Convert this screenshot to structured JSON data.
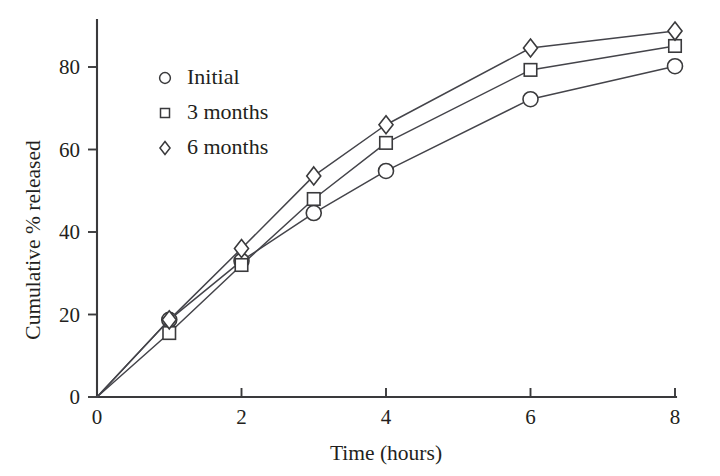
{
  "chart_data": {
    "type": "line",
    "title": "",
    "xlabel": "Time (hours)",
    "ylabel": "Cumulative % released",
    "xlim": [
      0,
      8.6
    ],
    "ylim": [
      0,
      92
    ],
    "xticks": [
      "0",
      "2",
      "4",
      "6",
      "8"
    ],
    "xtick_values": [
      0,
      2,
      4,
      6,
      8
    ],
    "yticks": [
      "0",
      "20",
      "40",
      "60",
      "80"
    ],
    "ytick_values": [
      0,
      20,
      40,
      60,
      80
    ],
    "grid": false,
    "legend_position": "upper-left-inside",
    "x": [
      0,
      1,
      2,
      3,
      4,
      6,
      8
    ],
    "series": [
      {
        "name": "Initial",
        "marker": "circle",
        "values": [
          0,
          18.7,
          33.0,
          44.6,
          54.8,
          72.2,
          80.2
        ]
      },
      {
        "name": "3 months",
        "marker": "square",
        "values": [
          0,
          15.5,
          32.0,
          48.0,
          61.6,
          79.3,
          85.1
        ]
      },
      {
        "name": "6 months",
        "marker": "diamond",
        "values": [
          0,
          18.7,
          36.0,
          53.6,
          66.0,
          84.6,
          88.7
        ]
      }
    ],
    "colors": {
      "line": "#44444a",
      "marker_fill": "#ffffff",
      "marker_stroke": "#3a3a3c",
      "axis": "#3a3a3c",
      "text": "#231f20",
      "background": "#ffffff"
    }
  },
  "legend": {
    "items": [
      {
        "label": "Initial",
        "marker": "circle"
      },
      {
        "label": "3 months",
        "marker": "square"
      },
      {
        "label": "6 months",
        "marker": "diamond"
      }
    ]
  }
}
